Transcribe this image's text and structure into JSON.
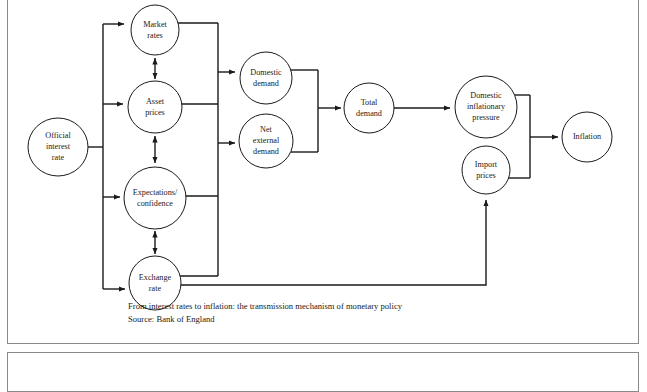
{
  "figure": {
    "caption": "From interest rates to inflation: the transmission mechanism of monetary policy",
    "source": "Source: Bank of England",
    "border_color": "#8a8a8a",
    "ink_color": "#1a1a1a",
    "background_color": "#ffffff"
  },
  "diagram": {
    "type": "flowchart",
    "nodes": [
      {
        "id": "official-interest-rate",
        "label_lines": [
          "Official",
          "interest",
          "rate"
        ],
        "cx": 58,
        "cy": 147,
        "r": 29
      },
      {
        "id": "market-rates",
        "label_lines": [
          "Market",
          "rates"
        ],
        "cx": 155,
        "cy": 30,
        "r": 24
      },
      {
        "id": "asset-prices",
        "label_lines": [
          "Asset",
          "prices"
        ],
        "cx": 155,
        "cy": 107,
        "r": 26
      },
      {
        "id": "expectations-confidence",
        "label_lines": [
          "Expectations/",
          "confidence"
        ],
        "cx": 155,
        "cy": 198,
        "r": 31
      },
      {
        "id": "exchange-rate",
        "label_lines": [
          "Exchange",
          "rate"
        ],
        "cx": 155,
        "cy": 283,
        "r": 26
      },
      {
        "id": "domestic-demand",
        "label_lines": [
          "Domestic",
          "demand"
        ],
        "cx": 266,
        "cy": 78,
        "r": 26
      },
      {
        "id": "net-external-demand",
        "label_lines": [
          "Net",
          "external",
          "demand"
        ],
        "cx": 266,
        "cy": 141,
        "r": 27
      },
      {
        "id": "total-demand",
        "label_lines": [
          "Total",
          "demand"
        ],
        "cx": 369,
        "cy": 108,
        "r": 24
      },
      {
        "id": "domestic-inflationary-pressure",
        "label_lines": [
          "Domestic",
          "inflationary",
          "pressure"
        ],
        "cx": 486,
        "cy": 107,
        "r": 31
      },
      {
        "id": "import-prices",
        "label_lines": [
          "Import",
          "prices"
        ],
        "cx": 486,
        "cy": 170,
        "r": 24
      },
      {
        "id": "inflation",
        "label_lines": [
          "Inflation"
        ],
        "cx": 587,
        "cy": 137,
        "r": 24
      }
    ],
    "edges": [
      {
        "from": "official-interest-rate",
        "to": "market-rates",
        "kind": "arrow"
      },
      {
        "from": "official-interest-rate",
        "to": "asset-prices",
        "kind": "arrow"
      },
      {
        "from": "official-interest-rate",
        "to": "expectations-confidence",
        "kind": "arrow"
      },
      {
        "from": "official-interest-rate",
        "to": "exchange-rate",
        "kind": "arrow"
      },
      {
        "from": "market-rates",
        "to": "asset-prices",
        "kind": "double-arrow"
      },
      {
        "from": "asset-prices",
        "to": "expectations-confidence",
        "kind": "double-arrow"
      },
      {
        "from": "expectations-confidence",
        "to": "exchange-rate",
        "kind": "double-arrow"
      },
      {
        "from": "left-bus",
        "to": "domestic-demand",
        "kind": "arrow"
      },
      {
        "from": "left-bus",
        "to": "net-external-demand",
        "kind": "arrow"
      },
      {
        "from": "domestic-demand",
        "to": "total-demand",
        "kind": "arrow"
      },
      {
        "from": "net-external-demand",
        "to": "total-demand",
        "kind": "arrow"
      },
      {
        "from": "total-demand",
        "to": "domestic-inflationary-pressure",
        "kind": "arrow"
      },
      {
        "from": "domestic-inflationary-pressure",
        "to": "inflation",
        "kind": "arrow"
      },
      {
        "from": "import-prices",
        "to": "inflation",
        "kind": "arrow"
      },
      {
        "from": "exchange-rate",
        "to": "import-prices",
        "kind": "arrow"
      }
    ]
  }
}
